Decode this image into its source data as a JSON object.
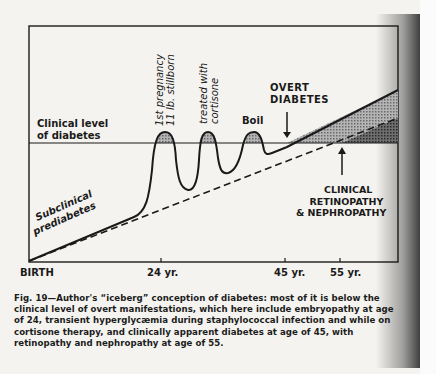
{
  "diagram": {
    "threshold_label_line1": "Clinical level",
    "threshold_label_line2": "of diabetes",
    "curve_label_line1": "Subclinical",
    "curve_label_line2": "prediabetes",
    "events": [
      {
        "label_line1": "1st pregnancy",
        "label_line2": "11 lb. stillborn",
        "age": 24
      },
      {
        "label_line1": "treated with",
        "label_line2": "cortisone"
      },
      {
        "label_line1": "Boil"
      }
    ],
    "overt_label_line1": "OVERT",
    "overt_label_line2": "DIABETES",
    "clinical_label_line1": "CLINICAL",
    "clinical_label_line2": "RETINOPATHY",
    "clinical_label_line3": "& NEPHROPATHY",
    "x_axis": {
      "ticks": [
        "BIRTH",
        "24 yr.",
        "45 yr.",
        "55 yr."
      ]
    }
  },
  "caption": {
    "figure_number": "Fig. 19",
    "text": "Fig. 19—Author's “iceberg” conception of diabetes: most of it is below the clinical level of overt manifestations, which here include embryopathy at age of 24, transient hyperglycæmia during staphylococcal infection and while on cortisone therapy, and clinically apparent diabetes at age of 45, with retinopathy and nephropathy at age of 55."
  }
}
